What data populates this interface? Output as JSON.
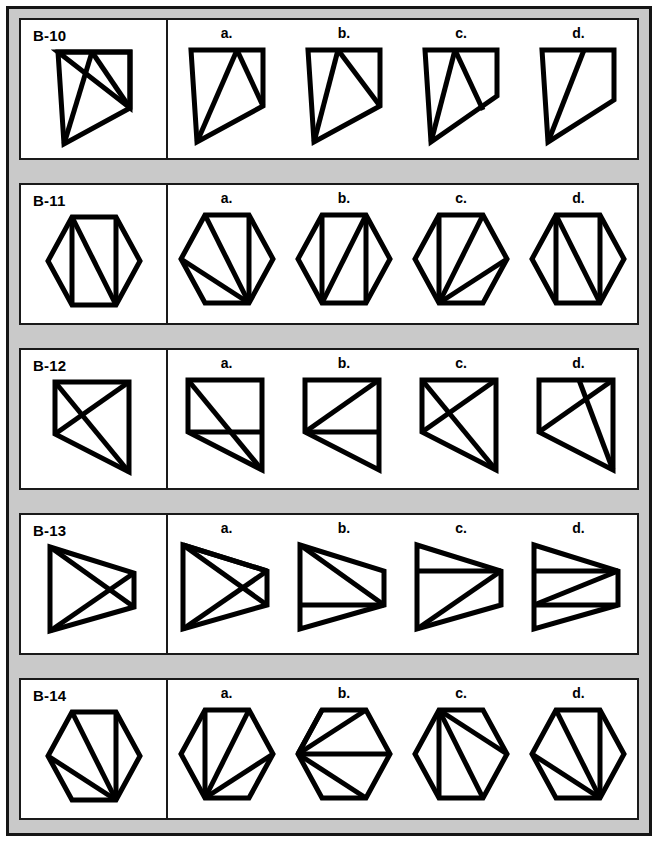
{
  "page": {
    "type": "paper-folding-and-figure-analogy-worksheet",
    "frame_color": "#c9c9c9",
    "ink_color": "#000000",
    "panel_color": "#ffffff"
  },
  "option_labels": [
    "a.",
    "b.",
    "c.",
    "d."
  ],
  "rows": [
    {
      "id": "B-10",
      "shape_family": "pentagon-cut-corner",
      "stem": {
        "outline": "100,20 220,20 220,20 220,100 160,180 100,20",
        "name": "stem-figure-b10"
      },
      "options": [
        {
          "label": "a.",
          "name": "option-figure-b10-a"
        },
        {
          "label": "b.",
          "name": "option-figure-b10-b"
        },
        {
          "label": "c.",
          "name": "option-figure-b10-c"
        },
        {
          "label": "d.",
          "name": "option-figure-b10-d"
        }
      ]
    },
    {
      "id": "B-11",
      "shape_family": "hexagon",
      "options": [
        {
          "label": "a.",
          "name": "option-figure-b11-a"
        },
        {
          "label": "b.",
          "name": "option-figure-b11-b"
        },
        {
          "label": "c.",
          "name": "option-figure-b11-c"
        },
        {
          "label": "d.",
          "name": "option-figure-b11-d"
        }
      ]
    },
    {
      "id": "B-12",
      "shape_family": "quadrilateral",
      "options": [
        {
          "label": "a.",
          "name": "option-figure-b12-a"
        },
        {
          "label": "b.",
          "name": "option-figure-b12-b"
        },
        {
          "label": "c.",
          "name": "option-figure-b12-c"
        },
        {
          "label": "d.",
          "name": "option-figure-b12-d"
        }
      ]
    },
    {
      "id": "B-13",
      "shape_family": "trapezoid",
      "options": [
        {
          "label": "a.",
          "name": "option-figure-b13-a"
        },
        {
          "label": "b.",
          "name": "option-figure-b13-b"
        },
        {
          "label": "c.",
          "name": "option-figure-b13-c"
        },
        {
          "label": "d.",
          "name": "option-figure-b13-d"
        }
      ]
    },
    {
      "id": "B-14",
      "shape_family": "hexagon",
      "options": [
        {
          "label": "a.",
          "name": "option-figure-b14-a"
        },
        {
          "label": "b.",
          "name": "option-figure-b14-b"
        },
        {
          "label": "c.",
          "name": "option-figure-b14-c"
        },
        {
          "label": "d.",
          "name": "option-figure-b14-d"
        }
      ]
    }
  ]
}
